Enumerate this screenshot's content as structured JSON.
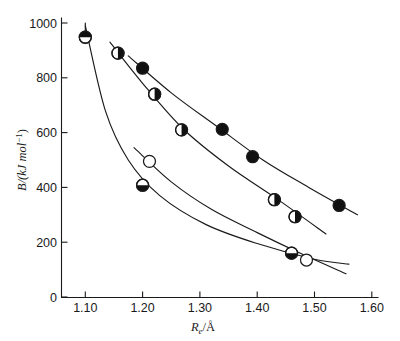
{
  "chart_data": {
    "type": "scatter",
    "title": "",
    "subtitle": "",
    "xlabel": "R_e/Å",
    "ylabel": "B/(kJ mol⁻¹)",
    "xlim": [
      1.05,
      1.63
    ],
    "ylim": [
      0,
      1040
    ],
    "xticks": [
      1.1,
      1.2,
      1.3,
      1.4,
      1.5,
      1.6
    ],
    "xtick_labels": [
      "1.10",
      "1.20",
      "1.30",
      "1.40",
      "1.50",
      "1.60"
    ],
    "yticks": [
      0,
      200,
      400,
      600,
      800,
      1000
    ],
    "ytick_labels": [
      "0",
      "200",
      "400",
      "600",
      "800",
      "1000"
    ],
    "grid": false,
    "legend_position": "none",
    "series": [
      {
        "name": "triple-bond-series",
        "marker": "circle-filled",
        "points": [
          {
            "x": 1.2,
            "y": 835
          },
          {
            "x": 1.339,
            "y": 612
          },
          {
            "x": 1.392,
            "y": 512
          },
          {
            "x": 1.543,
            "y": 334
          }
        ],
        "fit_curve": [
          {
            "x": 1.175,
            "y": 880
          },
          {
            "x": 1.25,
            "y": 745
          },
          {
            "x": 1.33,
            "y": 622
          },
          {
            "x": 1.41,
            "y": 500
          },
          {
            "x": 1.49,
            "y": 400
          },
          {
            "x": 1.575,
            "y": 300
          }
        ]
      },
      {
        "name": "double-bond-series",
        "marker": "circle-right-half",
        "points": [
          {
            "x": 1.157,
            "y": 890
          },
          {
            "x": 1.221,
            "y": 740
          },
          {
            "x": 1.268,
            "y": 610
          },
          {
            "x": 1.43,
            "y": 355
          },
          {
            "x": 1.466,
            "y": 293
          }
        ],
        "fit_curve": [
          {
            "x": 1.143,
            "y": 930
          },
          {
            "x": 1.2,
            "y": 780
          },
          {
            "x": 1.27,
            "y": 615
          },
          {
            "x": 1.35,
            "y": 478
          },
          {
            "x": 1.44,
            "y": 350
          },
          {
            "x": 1.52,
            "y": 230
          }
        ]
      },
      {
        "name": "top-half-marker-series",
        "marker": "circle-top-half",
        "points": [
          {
            "x": 1.1,
            "y": 948
          }
        ],
        "fit_curve": []
      },
      {
        "name": "single-bond-series",
        "marker": "circle-bottom-half",
        "points": [
          {
            "x": 1.2,
            "y": 408
          },
          {
            "x": 1.46,
            "y": 160
          }
        ],
        "fit_curve": [
          {
            "x": 1.1,
            "y": 990
          },
          {
            "x": 1.135,
            "y": 680
          },
          {
            "x": 1.175,
            "y": 500
          },
          {
            "x": 1.23,
            "y": 370
          },
          {
            "x": 1.31,
            "y": 265
          },
          {
            "x": 1.4,
            "y": 195
          },
          {
            "x": 1.5,
            "y": 138
          },
          {
            "x": 1.56,
            "y": 120
          }
        ]
      },
      {
        "name": "open-circle-series",
        "marker": "circle-open",
        "points": [
          {
            "x": 1.212,
            "y": 495
          },
          {
            "x": 1.486,
            "y": 135
          }
        ],
        "fit_curve": [
          {
            "x": 1.185,
            "y": 545
          },
          {
            "x": 1.25,
            "y": 420
          },
          {
            "x": 1.32,
            "y": 320
          },
          {
            "x": 1.4,
            "y": 235
          },
          {
            "x": 1.48,
            "y": 155
          },
          {
            "x": 1.555,
            "y": 85
          }
        ]
      }
    ],
    "annotations": []
  },
  "axes": {
    "x_title_symbol": "R",
    "x_title_sub": "e",
    "x_title_rest": "/Å",
    "y_title_main": "B/(kJ mol",
    "y_title_sup": "−1",
    "y_title_close": ")"
  }
}
